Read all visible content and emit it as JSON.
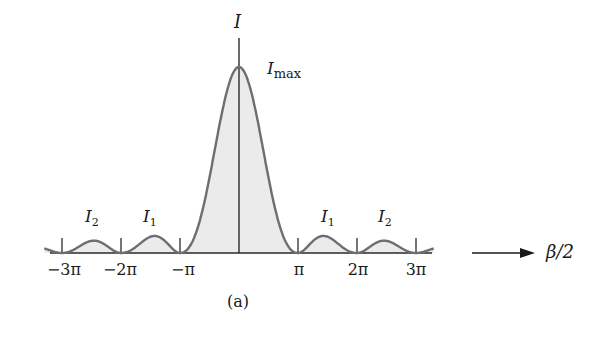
{
  "chart_data": {
    "type": "line",
    "title": "",
    "subtitle": "",
    "xlabel": "β/2",
    "ylabel": "I",
    "caption": "(a)",
    "xlim": [
      -3.3,
      3.3
    ],
    "x_units": "π",
    "ylim": [
      0,
      1.0
    ],
    "grid": false,
    "legend": null,
    "x_ticks": [
      -3,
      -2,
      -1,
      1,
      2,
      3
    ],
    "x_tick_labels": [
      "−3π",
      "−2π",
      "−π",
      "π",
      "2π",
      "3π"
    ],
    "series": [
      {
        "name": "I (single-slit intensity, sinc²)",
        "formula": "I = I_max [sin(β/2)/(β/2)]²",
        "x": [
          -3.3,
          -3,
          -2.5,
          -2,
          -1.5,
          -1,
          -0.5,
          0,
          0.5,
          1,
          1.5,
          2,
          2.5,
          3,
          3.3
        ],
        "values": [
          0.008,
          0,
          0.016,
          0,
          0.045,
          0,
          0.405,
          1.0,
          0.405,
          0,
          0.045,
          0,
          0.016,
          0,
          0.008
        ]
      }
    ],
    "annotations": [
      {
        "text": "I_max",
        "at": "central peak",
        "x": 0,
        "y": 1.0
      },
      {
        "text": "I_1",
        "at": "first secondary maximum (left)",
        "x": -1.43
      },
      {
        "text": "I_1",
        "at": "first secondary maximum (right)",
        "x": 1.43
      },
      {
        "text": "I_2",
        "at": "second secondary maximum (left)",
        "x": -2.46
      },
      {
        "text": "I_2",
        "at": "second secondary maximum (right)",
        "x": 2.46
      }
    ],
    "fill_under_curve": true
  },
  "labels": {
    "y_axis": "I",
    "x_axis": "β/2",
    "imax_main": "I",
    "imax_sub": "max",
    "i1_main": "I",
    "i1_sub": "1",
    "i2_main": "I",
    "i2_sub": "2",
    "caption": "(a)",
    "ticks": [
      "−3π",
      "−2π",
      "−π",
      "π",
      "2π",
      "3π"
    ]
  },
  "colors": {
    "curve": "#6e6e6e",
    "fill": "#ebebeb",
    "axis": "#2a2a2a",
    "text": "#1a1a1a"
  }
}
